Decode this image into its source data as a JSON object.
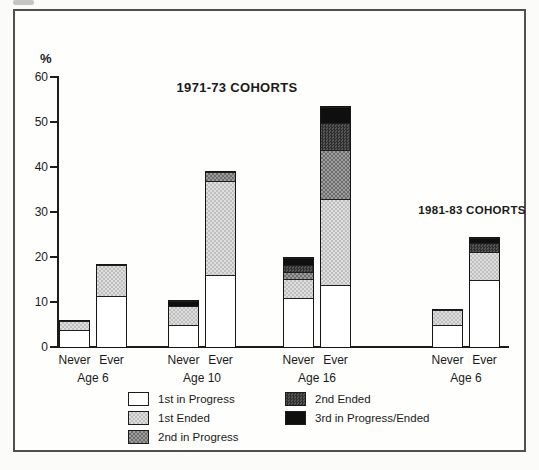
{
  "figure": {
    "percent_symbol": "%",
    "cohort_labels": {
      "first": "1971-73 COHORTS",
      "second": "1981-83 COHORTS"
    }
  },
  "legend": {
    "items": [
      {
        "label": "1st in Progress",
        "pattern": "white"
      },
      {
        "label": "1st Ended",
        "pattern": "light"
      },
      {
        "label": "2nd in Progress",
        "pattern": "medium"
      },
      {
        "label": "2nd Ended",
        "pattern": "dark"
      },
      {
        "label": "3rd in Progress/Ended",
        "pattern": "black"
      }
    ]
  },
  "colors": {
    "first_in_progress": "#ffffff",
    "first_ended": "#cfcfcf",
    "second_in_progress": "#8a8a8a",
    "second_ended": "#404040",
    "third_in_progress_ended": "#0f0f0f",
    "axis": "#1c1c1c",
    "frame": "#4f4f4f"
  },
  "chart_data": {
    "type": "bar",
    "stacked": true,
    "title": "",
    "ylabel": "%",
    "xlabel": "",
    "ylim": [
      0,
      60
    ],
    "yticks": [
      0,
      10,
      20,
      30,
      40,
      50,
      60
    ],
    "grid": false,
    "legend_position": "bottom",
    "series_names": [
      "1st in Progress",
      "1st Ended",
      "2nd in Progress",
      "2nd Ended",
      "3rd in Progress/Ended"
    ],
    "annotations": [
      "1971-73 COHORTS",
      "1981-83 COHORTS"
    ],
    "groups": [
      {
        "cohort": "1971-73",
        "age_label": "Age 6",
        "bars": [
          {
            "label": "Never",
            "values": [
              4,
              2,
              0,
              0,
              0
            ],
            "total": 6
          },
          {
            "label": "Ever",
            "values": [
              11.5,
              7,
              0,
              0,
              0
            ],
            "total": 18.5
          }
        ]
      },
      {
        "cohort": "1971-73",
        "age_label": "Age 10",
        "bars": [
          {
            "label": "Never",
            "values": [
              5,
              4.5,
              0,
              0,
              1
            ],
            "total": 10.5
          },
          {
            "label": "Ever",
            "values": [
              16,
              21,
              2,
              0,
              0
            ],
            "total": 39
          }
        ]
      },
      {
        "cohort": "1971-73",
        "age_label": "Age 16",
        "bars": [
          {
            "label": "Never",
            "values": [
              11,
              4.5,
              1.5,
              1.5,
              1.5
            ],
            "total": 20
          },
          {
            "label": "Ever",
            "values": [
              14,
              19,
              11,
              6,
              3.5
            ],
            "total": 53.5
          }
        ]
      },
      {
        "cohort": "1981-83",
        "age_label": "Age 6",
        "bars": [
          {
            "label": "Never",
            "values": [
              5,
              3.5,
              0,
              0,
              0
            ],
            "total": 8.5
          },
          {
            "label": "Ever",
            "values": [
              15,
              6.5,
              0,
              2,
              1
            ],
            "total": 24.5
          }
        ]
      }
    ]
  }
}
